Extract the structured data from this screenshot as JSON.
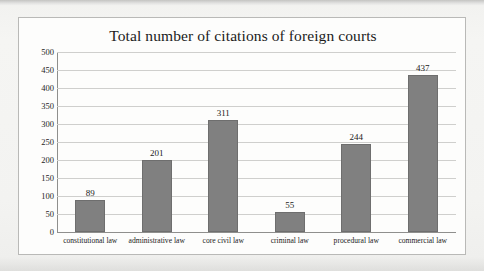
{
  "chart_data": {
    "type": "bar",
    "title": "Total number of citations of foreign courts",
    "xlabel": "",
    "ylabel": "",
    "categories": [
      "constitutional law",
      "administrative law",
      "core civil law",
      "criminal law",
      "procedural law",
      "commercial law"
    ],
    "values": [
      89,
      201,
      311,
      55,
      244,
      437
    ],
    "value_labels": [
      "89",
      "201",
      "311",
      "55",
      "244",
      "437"
    ],
    "ylim": [
      0,
      500
    ],
    "ytick_step": 50,
    "yticks": [
      0,
      50,
      100,
      150,
      200,
      250,
      300,
      350,
      400,
      450,
      500
    ],
    "ytick_labels": [
      "0",
      "50",
      "100",
      "150",
      "200",
      "250",
      "300",
      "350",
      "400",
      "450",
      "500"
    ],
    "grid": true,
    "grid_axis": "y",
    "legend": false,
    "legend_position": "none",
    "series": [
      {
        "name": "Total citations",
        "values": [
          89,
          201,
          311,
          55,
          244,
          437
        ],
        "color": "#808080"
      }
    ],
    "colors": {
      "bar_fill": "#808080",
      "bar_border": "#6e6e6e",
      "gridline": "#cfcfcd",
      "axis": "#8f8f8d",
      "plot_background": "#fdfdfc",
      "frame_border": "#b9b9b7",
      "page_background": "#f2f2f0",
      "text": "#1b1b1b"
    }
  }
}
